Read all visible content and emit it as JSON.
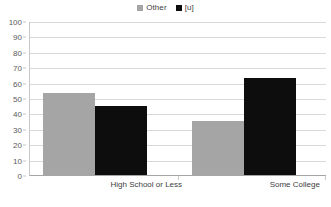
{
  "chart_data": {
    "type": "bar",
    "title": "",
    "subtitle": "",
    "xlabel": "",
    "ylabel": "",
    "categories": [
      "High School or Less",
      "Some College"
    ],
    "series": [
      {
        "name": "Other",
        "color": "#A5A5A5",
        "values": [
          53,
          35
        ]
      },
      {
        "name": "[u]",
        "color": "#0D0D0D",
        "values": [
          45,
          63
        ]
      }
    ],
    "ylim": [
      0,
      100
    ],
    "ytick_step": 10,
    "yticks": [
      0,
      10,
      20,
      30,
      40,
      50,
      60,
      70,
      80,
      90,
      100
    ],
    "ytick_labels": [
      "0",
      "10",
      "20",
      "30",
      "40",
      "50",
      "60",
      "70",
      "80",
      "90",
      "100"
    ],
    "grid": true,
    "grid_axis": "y",
    "grid_color": "#D9D9D9",
    "legend": true,
    "legend_position": "top-center",
    "legend_entries": [
      {
        "label": "Other",
        "swatch_color": "#A5A5A5",
        "swatch_icon": "square-swatch-icon"
      },
      {
        "label": "[u]",
        "swatch_color": "#0D0D0D",
        "swatch_icon": "square-swatch-icon"
      }
    ],
    "background_color": "#FFFFFF",
    "axis_color": "#A6A6A6"
  }
}
